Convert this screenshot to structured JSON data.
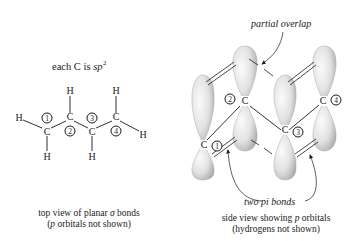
{
  "left_panel": {
    "heading_prefix": "each C is ",
    "heading_hybrid": "sp",
    "heading_superscript": "2",
    "atoms": [
      {
        "label": "H",
        "role": "terminal-h-left"
      },
      {
        "label": "C",
        "role": "carbon-1"
      },
      {
        "label": "H",
        "role": "h-on-c1"
      },
      {
        "label": "H",
        "role": "h-on-c2"
      },
      {
        "label": "C",
        "role": "carbon-2"
      },
      {
        "label": "C",
        "role": "carbon-3"
      },
      {
        "label": "H",
        "role": "h-on-c3"
      },
      {
        "label": "H",
        "role": "h-on-c4"
      },
      {
        "label": "C",
        "role": "carbon-4"
      },
      {
        "label": "H",
        "role": "terminal-h-right"
      }
    ],
    "numbers": [
      "1",
      "2",
      "3",
      "4"
    ],
    "caption_line1_prefix": "top view of planar ",
    "caption_line1_sigma": "σ",
    "caption_line1_suffix": " bonds",
    "caption_line2_open": "(",
    "caption_line2_p": "p",
    "caption_line2_rest": " orbitals not shown)"
  },
  "right_panel": {
    "annotation_top": "partial overlap",
    "annotation_bottom": "two pi bonds",
    "carbons": [
      {
        "label": "C",
        "number": "1"
      },
      {
        "label": "C",
        "number": "2"
      },
      {
        "label": "C",
        "number": "3"
      },
      {
        "label": "C",
        "number": "4"
      }
    ],
    "caption_line1_prefix": "side view showing ",
    "caption_line1_p": "p",
    "caption_line1_suffix": " orbitals",
    "caption_line2": "(hydrogens not shown)"
  },
  "colors": {
    "background": "#ffffff",
    "ink": "#1a1a1a",
    "lobe_light": "#f4f4f4",
    "lobe_dark": "#b9b9b9"
  }
}
